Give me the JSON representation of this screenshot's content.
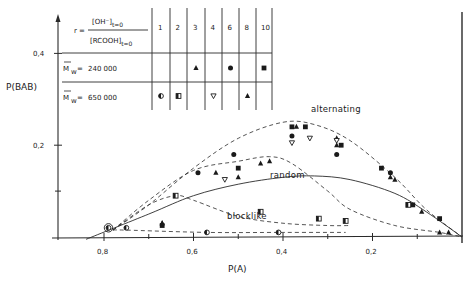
{
  "chart_data": {
    "type": "scatter",
    "title": "",
    "xlabel": "P(A)",
    "ylabel": "P(BAB)",
    "xlim": [
      0.9,
      0.0
    ],
    "ylim": [
      0.0,
      0.43
    ],
    "x_reversed": true,
    "grid": false,
    "x_ticks": [
      {
        "v": 0.8,
        "label": "0,8"
      },
      {
        "v": 0.6,
        "label": "0,6"
      },
      {
        "v": 0.4,
        "label": "0,4"
      },
      {
        "v": 0.2,
        "label": "0,2"
      }
    ],
    "x_minor_ticks": [
      0.7,
      0.5,
      0.3,
      0.1
    ],
    "y_ticks": [
      {
        "v": 0.4,
        "label": "0,4"
      },
      {
        "v": 0.2,
        "label": "0,2"
      }
    ],
    "y_minor_ticks": [
      0.1
    ],
    "legend_table": {
      "r_label": "r =",
      "r_numerator": "[OH⁻]",
      "r_numerator_sub": "t=0",
      "r_denominator": "[RCOOH]",
      "r_denominator_sub": "t=0",
      "r_values": [
        "1",
        "2",
        "3",
        "4",
        "6",
        "8",
        "10"
      ],
      "rows": [
        {
          "label": "M̄w=",
          "mw_symbol": "M",
          "mw_sub": "w",
          "value": "240 000",
          "markers": [
            "",
            "",
            "triangle",
            "",
            "circle",
            "",
            "square"
          ]
        },
        {
          "label": "M̄w=",
          "mw_symbol": "M",
          "mw_sub": "w",
          "value": "650 000",
          "markers": [
            "half-circle",
            "half-square",
            "",
            "triangle-down",
            "",
            "triangle",
            ""
          ]
        }
      ]
    },
    "curve_labels": {
      "alternating": "alternating",
      "random": "random",
      "blocklike": "blocklike"
    },
    "curves": [
      {
        "name": "alternating",
        "style": "dashed",
        "points": [
          [
            0.78,
            0.015
          ],
          [
            0.7,
            0.07
          ],
          [
            0.6,
            0.15
          ],
          [
            0.5,
            0.215
          ],
          [
            0.4,
            0.25
          ],
          [
            0.33,
            0.245
          ],
          [
            0.25,
            0.21
          ],
          [
            0.15,
            0.13
          ],
          [
            0.08,
            0.06
          ],
          [
            0.0,
            0.0
          ]
        ]
      },
      {
        "name": "random",
        "style": "solid",
        "points": [
          [
            0.84,
            -0.005
          ],
          [
            0.7,
            0.05
          ],
          [
            0.6,
            0.09
          ],
          [
            0.5,
            0.115
          ],
          [
            0.4,
            0.13
          ],
          [
            0.33,
            0.133
          ],
          [
            0.25,
            0.125
          ],
          [
            0.15,
            0.095
          ],
          [
            0.08,
            0.055
          ],
          [
            0.0,
            0.0
          ]
        ]
      },
      {
        "name": "intermediate-1",
        "style": "dashed",
        "points": [
          [
            0.78,
            0.015
          ],
          [
            0.7,
            0.08
          ],
          [
            0.6,
            0.145
          ],
          [
            0.5,
            0.165
          ],
          [
            0.43,
            0.175
          ],
          [
            0.38,
            0.16
          ],
          [
            0.3,
            0.1
          ],
          [
            0.25,
            0.06
          ],
          [
            0.15,
            0.025
          ],
          [
            0.05,
            0.01
          ],
          [
            0.0,
            0.0
          ]
        ]
      },
      {
        "name": "intermediate-2",
        "style": "dashed",
        "points": [
          [
            0.78,
            0.015
          ],
          [
            0.7,
            0.07
          ],
          [
            0.64,
            0.09
          ],
          [
            0.6,
            0.08
          ],
          [
            0.5,
            0.045
          ],
          [
            0.4,
            0.03
          ],
          [
            0.3,
            0.025
          ],
          [
            0.25,
            0.025
          ]
        ]
      },
      {
        "name": "blocklike",
        "style": "dashed",
        "points": [
          [
            0.78,
            0.015
          ],
          [
            0.75,
            0.015
          ],
          [
            0.57,
            0.01
          ],
          [
            0.4,
            0.01
          ],
          [
            0.26,
            0.01
          ]
        ]
      }
    ],
    "series": [
      {
        "name": "Mw=240000, r=3",
        "marker": "triangle",
        "points": [
          [
            0.67,
            0.03
          ],
          [
            0.5,
            0.13
          ],
          [
            0.43,
            0.165
          ],
          [
            0.37,
            0.24
          ],
          [
            0.28,
            0.215
          ],
          [
            0.15,
            0.125
          ],
          [
            0.05,
            0.01
          ]
        ]
      },
      {
        "name": "Mw=240000, r=6",
        "marker": "circle",
        "points": [
          [
            0.59,
            0.14
          ],
          [
            0.51,
            0.18
          ],
          [
            0.38,
            0.22
          ],
          [
            0.28,
            0.18
          ],
          [
            0.16,
            0.14
          ]
        ]
      },
      {
        "name": "Mw=240000, r=10",
        "marker": "square",
        "points": [
          [
            0.67,
            0.025
          ],
          [
            0.5,
            0.15
          ],
          [
            0.38,
            0.24
          ],
          [
            0.35,
            0.24
          ],
          [
            0.27,
            0.2
          ],
          [
            0.18,
            0.15
          ],
          [
            0.11,
            0.07
          ],
          [
            0.05,
            0.04
          ]
        ]
      },
      {
        "name": "Mw=650000, r=1",
        "marker": "half-circle",
        "points": [
          [
            0.79,
            0.02
          ],
          [
            0.75,
            0.02
          ],
          [
            0.57,
            0.01
          ],
          [
            0.41,
            0.01
          ]
        ]
      },
      {
        "name": "Mw=650000, r=2",
        "marker": "half-square",
        "points": [
          [
            0.64,
            0.09
          ],
          [
            0.45,
            0.055
          ],
          [
            0.32,
            0.04
          ],
          [
            0.26,
            0.035
          ],
          [
            0.12,
            0.07
          ]
        ]
      },
      {
        "name": "Mw=650000, r=4",
        "marker": "triangle-down",
        "points": [
          [
            0.53,
            0.125
          ],
          [
            0.38,
            0.205
          ],
          [
            0.34,
            0.215
          ],
          [
            0.28,
            0.21
          ]
        ]
      },
      {
        "name": "Mw=650000, r=8",
        "marker": "triangle",
        "points": [
          [
            0.67,
            0.03
          ],
          [
            0.55,
            0.14
          ],
          [
            0.45,
            0.16
          ],
          [
            0.28,
            0.2
          ],
          [
            0.16,
            0.13
          ],
          [
            0.09,
            0.055
          ],
          [
            0.03,
            0.01
          ]
        ]
      }
    ]
  }
}
